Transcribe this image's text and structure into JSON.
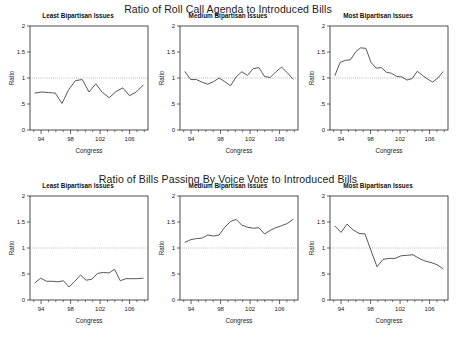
{
  "figure": {
    "width": 456,
    "height": 341,
    "background": "#ffffff",
    "line_color": "#3a3a3a",
    "reference_line_color": "#777777",
    "axis_color": "#222222"
  },
  "chart_data": [
    {
      "type": "line",
      "title": "Ratio of Roll Call Agenda to Introduced Bills",
      "panel_title": "Least Bipartisan Issues",
      "panel_index": 0,
      "row": "top",
      "xlabel": "Congress",
      "ylabel": "Ratio",
      "xlim": [
        92.5,
        108.5
      ],
      "ylim": [
        0,
        2
      ],
      "xticks": [
        94,
        98,
        102,
        106
      ],
      "xtick_labels": [
        "94",
        "98",
        "102",
        "106"
      ],
      "yticks": [
        0,
        0.5,
        1,
        1.5,
        2
      ],
      "ytick_labels": [
        "0",
        ".5",
        "1",
        "1.5",
        "2"
      ],
      "grid": false,
      "legend": "none",
      "reference_line_y": 1,
      "x": [
        93,
        94,
        95,
        96,
        97,
        98,
        99,
        100,
        101,
        102,
        103,
        104,
        105,
        106,
        107,
        108
      ],
      "values": [
        0.71,
        0.73,
        0.72,
        0.71,
        0.51,
        0.78,
        0.95,
        0.97,
        0.73,
        0.89,
        0.72,
        0.62,
        0.74,
        0.81,
        0.66,
        0.73,
        0.86
      ]
    },
    {
      "type": "line",
      "title": "Ratio of Roll Call Agenda to Introduced Bills",
      "panel_title": "Medium Bipartisan Issues",
      "panel_index": 1,
      "row": "top",
      "xlabel": "Congress",
      "ylabel": "Ratio",
      "xlim": [
        92.5,
        108.5
      ],
      "ylim": [
        0,
        2
      ],
      "xticks": [
        94,
        98,
        102,
        106
      ],
      "xtick_labels": [
        "94",
        "98",
        "102",
        "106"
      ],
      "yticks": [
        0,
        0.5,
        1,
        1.5,
        2
      ],
      "ytick_labels": [
        "0",
        ".5",
        "1",
        "1.5",
        "2"
      ],
      "grid": false,
      "legend": "none",
      "reference_line_y": 1,
      "x": [
        93,
        94,
        95,
        96,
        97,
        98,
        99,
        100,
        101,
        102,
        103,
        104,
        105,
        106,
        107,
        108
      ],
      "values": [
        1.12,
        0.97,
        0.97,
        0.92,
        0.88,
        0.93,
        1.0,
        0.93,
        0.85,
        1.02,
        1.12,
        1.05,
        1.18,
        1.2,
        1.03,
        1.01,
        1.12,
        1.21,
        1.1,
        0.98
      ]
    },
    {
      "type": "line",
      "title": "Ratio of Roll Call Agenda to Introduced Bills",
      "panel_title": "Most Bipartisan Issues",
      "panel_index": 2,
      "row": "top",
      "xlabel": "Congress",
      "ylabel": "Ratio",
      "xlim": [
        92.5,
        108.5
      ],
      "ylim": [
        0,
        2
      ],
      "xticks": [
        94,
        98,
        102,
        106
      ],
      "xtick_labels": [
        "94",
        "98",
        "102",
        "106"
      ],
      "yticks": [
        0,
        0.5,
        1,
        1.5,
        2
      ],
      "ytick_labels": [
        "0",
        ".5",
        "1",
        "1.5",
        "2"
      ],
      "grid": false,
      "legend": "none",
      "reference_line_y": 1,
      "x": [
        93,
        94,
        95,
        96,
        97,
        98,
        99,
        100,
        101,
        102,
        103,
        104,
        105,
        106,
        107,
        108
      ],
      "values": [
        1.05,
        1.3,
        1.34,
        1.35,
        1.5,
        1.58,
        1.57,
        1.3,
        1.19,
        1.2,
        1.11,
        1.09,
        1.03,
        1.02,
        0.96,
        0.99,
        1.13,
        1.05,
        0.98,
        0.92,
        1.0,
        1.12
      ]
    },
    {
      "type": "line",
      "title": "Ratio of Bills Passing By Voice Vote to Introduced Bills",
      "panel_title": "Least Bipartisan Issues",
      "panel_index": 0,
      "row": "bottom",
      "xlabel": "Congress",
      "ylabel": "Ratio",
      "xlim": [
        92.5,
        108.5
      ],
      "ylim": [
        0,
        2
      ],
      "xticks": [
        94,
        98,
        102,
        106
      ],
      "xtick_labels": [
        "94",
        "98",
        "102",
        "106"
      ],
      "yticks": [
        0,
        0.5,
        1,
        1.5,
        2
      ],
      "ytick_labels": [
        "0",
        ".5",
        "1",
        "1.5",
        "2"
      ],
      "grid": false,
      "legend": "none",
      "reference_line_y": 1,
      "x": [
        93,
        94,
        95,
        96,
        97,
        98,
        99,
        100,
        101,
        102,
        103,
        104,
        105,
        106,
        107,
        108
      ],
      "values": [
        0.33,
        0.42,
        0.36,
        0.36,
        0.35,
        0.37,
        0.25,
        0.36,
        0.48,
        0.38,
        0.4,
        0.51,
        0.53,
        0.52,
        0.59,
        0.37,
        0.41,
        0.41,
        0.41,
        0.42
      ]
    },
    {
      "type": "line",
      "title": "Ratio of Bills Passing By Voice Vote to Introduced Bills",
      "panel_title": "Medium Bipartisan Issues",
      "panel_index": 1,
      "row": "bottom",
      "xlabel": "Congress",
      "ylabel": "Ratio",
      "xlim": [
        92.5,
        108.5
      ],
      "ylim": [
        0,
        2
      ],
      "xticks": [
        94,
        98,
        102,
        106
      ],
      "xtick_labels": [
        "94",
        "98",
        "102",
        "106"
      ],
      "yticks": [
        0,
        0.5,
        1,
        1.5,
        2
      ],
      "ytick_labels": [
        "0",
        ".5",
        "1",
        "1.5",
        "2"
      ],
      "grid": false,
      "legend": "none",
      "reference_line_y": 1,
      "x": [
        93,
        94,
        95,
        96,
        97,
        98,
        99,
        100,
        101,
        102,
        103,
        104,
        105,
        106,
        107,
        108
      ],
      "values": [
        1.11,
        1.16,
        1.18,
        1.19,
        1.25,
        1.23,
        1.25,
        1.4,
        1.51,
        1.55,
        1.44,
        1.4,
        1.38,
        1.39,
        1.27,
        1.34,
        1.39,
        1.43,
        1.47,
        1.55
      ]
    },
    {
      "type": "line",
      "title": "Ratio of Bills Passing By Voice Vote to Introduced Bills",
      "panel_title": "Most Bipartisan Issues",
      "panel_index": 2,
      "row": "bottom",
      "xlabel": "Congress",
      "ylabel": "Ratio",
      "xlim": [
        92.5,
        108.5
      ],
      "ylim": [
        0,
        2
      ],
      "xticks": [
        94,
        98,
        102,
        106
      ],
      "xtick_labels": [
        "94",
        "98",
        "102",
        "106"
      ],
      "yticks": [
        0,
        0.5,
        1,
        1.5,
        2
      ],
      "ytick_labels": [
        "0",
        ".5",
        "1",
        "1.5",
        "2"
      ],
      "grid": false,
      "legend": "none",
      "reference_line_y": 1,
      "x": [
        93,
        94,
        95,
        96,
        97,
        98,
        99,
        100,
        101,
        102,
        103,
        104,
        105,
        106,
        107,
        108
      ],
      "values": [
        1.42,
        1.3,
        1.46,
        1.35,
        1.28,
        1.27,
        0.95,
        0.64,
        0.78,
        0.8,
        0.8,
        0.85,
        0.86,
        0.87,
        0.8,
        0.75,
        0.72,
        0.68,
        0.6
      ]
    }
  ],
  "rows": [
    {
      "id": "top",
      "title": "Ratio of Roll Call Agenda to Introduced Bills",
      "panels": [
        {
          "title": "Least Bipartisan Issues",
          "xlabel": "Congress",
          "ylabel": "Ratio"
        },
        {
          "title": "Medium Bipartisan Issues",
          "xlabel": "Congress",
          "ylabel": "Ratio"
        },
        {
          "title": "Most Bipartisan Issues",
          "xlabel": "Congress",
          "ylabel": "Ratio"
        }
      ]
    },
    {
      "id": "bottom",
      "title": "Ratio of Bills Passing By Voice Vote to Introduced Bills",
      "panels": [
        {
          "title": "Least Bipartisan Issues",
          "xlabel": "Congress",
          "ylabel": "Ratio"
        },
        {
          "title": "Medium Bipartisan Issues",
          "xlabel": "Congress",
          "ylabel": "Ratio"
        },
        {
          "title": "Most Bipartisan Issues",
          "xlabel": "Congress",
          "ylabel": "Ratio"
        }
      ]
    }
  ]
}
